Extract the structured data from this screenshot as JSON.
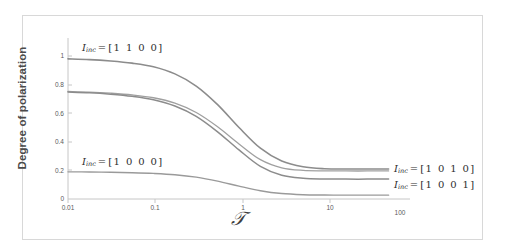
{
  "figure": {
    "background_color": "#ffffff",
    "frame_color": "#d8d8d8"
  },
  "chart_data": {
    "type": "line",
    "title": "",
    "subtitle": "",
    "xlabel": "𝒯",
    "ylabel": "Degree of polarization",
    "x_scale": "log",
    "xlim": [
      0.01,
      100
    ],
    "ylim": [
      0,
      1
    ],
    "xticks": [
      0.01,
      0.1,
      1,
      10,
      100
    ],
    "xtick_labels": [
      "0.01",
      "0.1",
      "1",
      "10",
      "100"
    ],
    "yticks": [
      0,
      0.2,
      0.4,
      0.6,
      0.8,
      1
    ],
    "ytick_labels": [
      "0",
      "0.2",
      "0.4",
      "0.6",
      "0.8",
      "1"
    ],
    "grid": false,
    "legend_position": "inline-annotations",
    "x": [
      0.01,
      0.0178,
      0.0316,
      0.0562,
      0.1,
      0.178,
      0.316,
      0.562,
      1,
      1.78,
      3.16,
      5.62,
      10,
      17.8,
      31.6,
      56.2
    ],
    "series": [
      {
        "name": "I_inc = [1 1 0 0]",
        "color": "#8c8c8c",
        "linewidth": 1.6,
        "values": [
          0.98,
          0.975,
          0.965,
          0.95,
          0.925,
          0.875,
          0.79,
          0.66,
          0.5,
          0.355,
          0.265,
          0.225,
          0.212,
          0.21,
          0.21,
          0.21
        ]
      },
      {
        "name": "I_inc = [1 0 1 0]",
        "color": "#a0a0a0",
        "linewidth": 1.3,
        "values": [
          0.752,
          0.748,
          0.74,
          0.728,
          0.708,
          0.67,
          0.605,
          0.505,
          0.385,
          0.275,
          0.218,
          0.2,
          0.197,
          0.196,
          0.196,
          0.196
        ]
      },
      {
        "name": "I_inc = [1 0 0 1]",
        "color": "#8c8c8c",
        "linewidth": 1.5,
        "values": [
          0.748,
          0.743,
          0.733,
          0.718,
          0.694,
          0.65,
          0.578,
          0.47,
          0.343,
          0.228,
          0.166,
          0.145,
          0.14,
          0.139,
          0.139,
          0.139
        ]
      },
      {
        "name": "I_inc = [1 0 0 0]",
        "color": "#9a9a9a",
        "linewidth": 1.4,
        "values": [
          0.19,
          0.189,
          0.187,
          0.184,
          0.179,
          0.17,
          0.153,
          0.125,
          0.09,
          0.058,
          0.038,
          0.03,
          0.028,
          0.027,
          0.027,
          0.027
        ]
      }
    ],
    "annotations": [
      {
        "id": "annot-top-left",
        "text": "I_inc = [1 1 0 0]",
        "symbol": "I",
        "subscript": "inc",
        "relation": "=",
        "vector": "1 1 0 0"
      },
      {
        "id": "annot-bottom-left",
        "text": "I_inc = [1 0 0 0]",
        "symbol": "I",
        "subscript": "inc",
        "relation": "=",
        "vector": "1 0 0 0"
      },
      {
        "id": "annot-right-upper",
        "text": "I_inc = [1 0 1 0]",
        "symbol": "I",
        "subscript": "inc",
        "relation": "=",
        "vector": "1 0 1 0"
      },
      {
        "id": "annot-right-lower",
        "text": "I_inc = [1 0 0 1]",
        "symbol": "I",
        "subscript": "inc",
        "relation": "=",
        "vector": "1 0 0 1"
      }
    ]
  }
}
